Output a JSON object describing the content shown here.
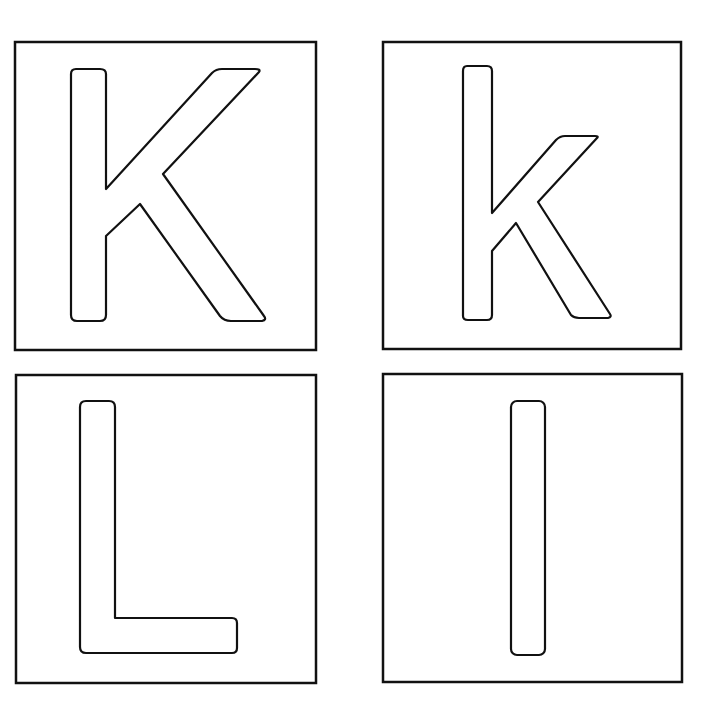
{
  "title": "Letter tracing cards K k L l",
  "cards": [
    {
      "letter": "K",
      "case": "uppercase",
      "position": "top-left"
    },
    {
      "letter": "k",
      "case": "lowercase",
      "position": "top-right"
    },
    {
      "letter": "L",
      "case": "uppercase",
      "position": "bottom-left"
    },
    {
      "letter": "l",
      "case": "lowercase",
      "position": "bottom-right"
    }
  ],
  "colors": {
    "outline": "#111111",
    "background": "#ffffff"
  }
}
